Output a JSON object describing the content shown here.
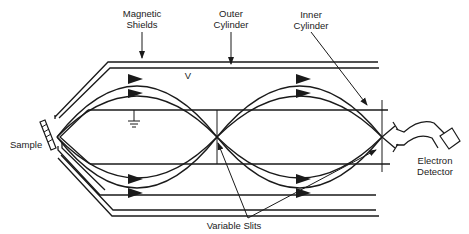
{
  "diagram": {
    "labels": {
      "magnetic_shields": [
        "Magnetic",
        "Shields"
      ],
      "outer_cylinder": [
        "Outer",
        "Cylinder"
      ],
      "inner_cylinder": [
        "Inner",
        "Cylinder"
      ],
      "voltage": "V",
      "sample": "Sample",
      "electron_detector": [
        "Electron",
        "Detector"
      ],
      "variable_slits": "Variable Slits"
    },
    "colors": {
      "line": "#1a1a1a",
      "background": "#ffffff",
      "text": "#222222"
    }
  }
}
